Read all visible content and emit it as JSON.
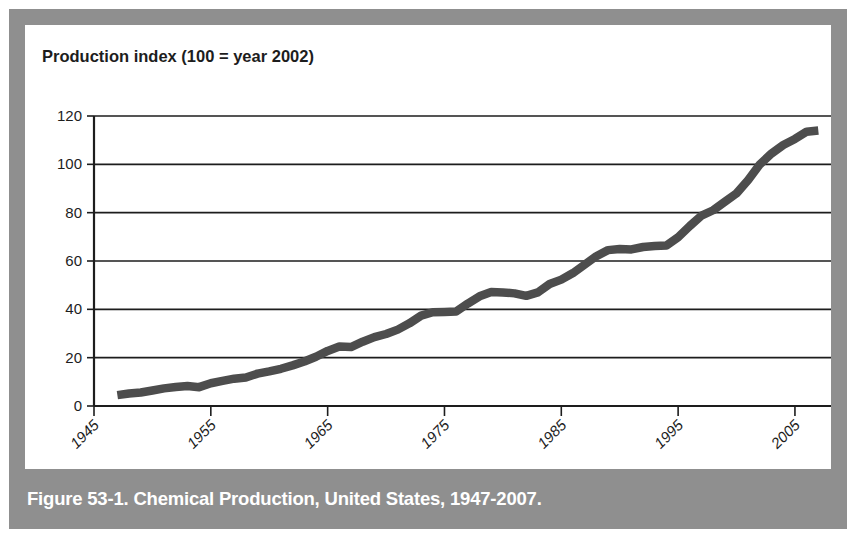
{
  "figure": {
    "caption": "Figure 53-1. Chemical Production, United States, 1947-2007.",
    "frame_color": "#8f8f8f",
    "panel_color": "#ffffff"
  },
  "chart_data": {
    "type": "line",
    "title": "Production index (100 = year 2002)",
    "xlabel": "",
    "ylabel": "",
    "ylim": [
      0,
      120
    ],
    "xlim": [
      1945,
      2005
    ],
    "grid": true,
    "legend": "none",
    "line_color": "#4d4d4d",
    "axis_color": "#1d1d1d",
    "ytick_labels": [
      "0",
      "20",
      "40",
      "60",
      "80",
      "100",
      "120"
    ],
    "yticks": [
      0,
      20,
      40,
      60,
      80,
      100,
      120
    ],
    "xtick_labels": [
      "1945",
      "1955",
      "1965",
      "1975",
      "1985",
      "1995",
      "2005"
    ],
    "xticks": [
      1945,
      1955,
      1965,
      1975,
      1985,
      1995,
      2005
    ],
    "series": [
      {
        "name": "Chemical production index",
        "x": [
          1947,
          1948,
          1949,
          1950,
          1951,
          1952,
          1953,
          1954,
          1955,
          1956,
          1957,
          1958,
          1959,
          1960,
          1961,
          1962,
          1963,
          1964,
          1965,
          1966,
          1967,
          1968,
          1969,
          1970,
          1971,
          1972,
          1973,
          1974,
          1975,
          1976,
          1977,
          1978,
          1979,
          1980,
          1981,
          1982,
          1983,
          1984,
          1985,
          1986,
          1987,
          1988,
          1989,
          1990,
          1991,
          1992,
          1993,
          1994,
          1995,
          1996,
          1997,
          1998,
          1999,
          2000,
          2001,
          2002,
          2003,
          2004,
          2005,
          2006,
          2007
        ],
        "values": [
          4.5,
          5.2,
          5.6,
          6.4,
          7.3,
          7.9,
          8.3,
          7.8,
          9.4,
          10.4,
          11.3,
          11.8,
          13.4,
          14.3,
          15.4,
          16.8,
          18.4,
          20.4,
          22.8,
          24.6,
          24.4,
          26.6,
          28.5,
          29.8,
          31.6,
          34.2,
          37.4,
          38.8,
          38.9,
          39.1,
          42.4,
          45.4,
          47.2,
          47.0,
          46.6,
          45.6,
          47.0,
          50.5,
          52.3,
          55.0,
          58.5,
          62.0,
          64.5,
          65.0,
          64.8,
          65.8,
          66.2,
          66.4,
          69.8,
          74.5,
          78.8,
          81.0,
          84.5,
          88.0,
          93.5,
          100.0,
          104.5,
          108.0,
          110.5,
          113.5,
          114.0
        ]
      }
    ]
  }
}
